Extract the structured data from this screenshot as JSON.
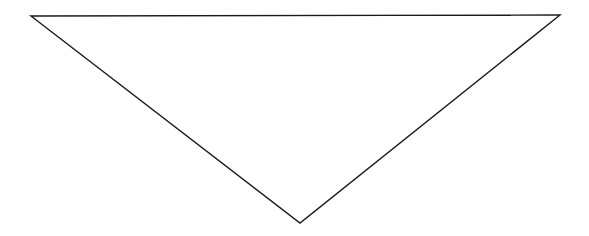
{
  "diagram": {
    "shape": "triangle",
    "orientation": "inverted",
    "fill": "#ffffff",
    "stroke": "#1a1a1a",
    "stroke_width": 1.4,
    "vertices": [
      {
        "name": "top-left",
        "x": 31,
        "y": 16
      },
      {
        "name": "top-right",
        "x": 560,
        "y": 15
      },
      {
        "name": "bottom",
        "x": 300,
        "y": 223
      }
    ]
  }
}
